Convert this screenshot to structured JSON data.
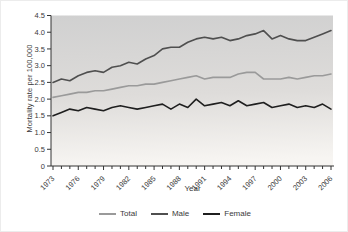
{
  "chart_data": {
    "type": "line",
    "title": "",
    "xlabel": "Year",
    "ylabel": "Mortality rate per 100,000",
    "ylim": [
      0,
      4.5
    ],
    "ytick_step": 0.5,
    "ytick_labels": [
      "0",
      "0.5",
      "1.0",
      "1.5",
      "2.0",
      "2.5",
      "3.0",
      "3.5",
      "4.0",
      "4.5"
    ],
    "x_start_year": 1973,
    "x_end_year": 2006,
    "xtick_label_interval": 3,
    "xtick_labels": [
      "1973",
      "1976",
      "1979",
      "1982",
      "1985",
      "1988",
      "1991",
      "1994",
      "1997",
      "2000",
      "2003",
      "2006"
    ],
    "grid": false,
    "legend_position": "bottom",
    "plot_background_top": "#d0d0d0",
    "plot_background_bottom": "#f7f5f2",
    "axis_color": "#333333",
    "tick_text_color": "#3a3a3a",
    "categories": [
      1973,
      1974,
      1975,
      1976,
      1977,
      1978,
      1979,
      1980,
      1981,
      1982,
      1983,
      1984,
      1985,
      1986,
      1987,
      1988,
      1989,
      1990,
      1991,
      1992,
      1993,
      1994,
      1995,
      1996,
      1997,
      1998,
      1999,
      2000,
      2001,
      2002,
      2003,
      2004,
      2005,
      2006
    ],
    "series": [
      {
        "name": "Total",
        "color": "#9a9a9a",
        "values": [
          2.05,
          2.1,
          2.15,
          2.2,
          2.2,
          2.25,
          2.25,
          2.3,
          2.35,
          2.4,
          2.4,
          2.45,
          2.45,
          2.5,
          2.55,
          2.6,
          2.65,
          2.7,
          2.6,
          2.65,
          2.65,
          2.65,
          2.75,
          2.8,
          2.8,
          2.6,
          2.6,
          2.6,
          2.65,
          2.6,
          2.65,
          2.7,
          2.7,
          2.75
        ]
      },
      {
        "name": "Male",
        "color": "#4f4f4f",
        "values": [
          2.5,
          2.6,
          2.55,
          2.7,
          2.8,
          2.85,
          2.8,
          2.95,
          3.0,
          3.1,
          3.05,
          3.2,
          3.3,
          3.5,
          3.55,
          3.55,
          3.7,
          3.8,
          3.85,
          3.8,
          3.85,
          3.75,
          3.8,
          3.9,
          3.95,
          4.05,
          3.8,
          3.9,
          3.8,
          3.75,
          3.75,
          3.85,
          3.95,
          4.05
        ]
      },
      {
        "name": "Female",
        "color": "#1f1f1f",
        "values": [
          1.5,
          1.6,
          1.7,
          1.65,
          1.75,
          1.7,
          1.65,
          1.75,
          1.8,
          1.75,
          1.7,
          1.75,
          1.8,
          1.85,
          1.7,
          1.85,
          1.75,
          2.0,
          1.8,
          1.85,
          1.9,
          1.8,
          1.95,
          1.8,
          1.85,
          1.9,
          1.75,
          1.8,
          1.85,
          1.75,
          1.8,
          1.75,
          1.85,
          1.7
        ]
      }
    ]
  }
}
